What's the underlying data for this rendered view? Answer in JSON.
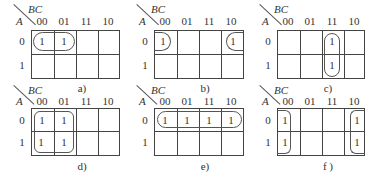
{
  "figure": {
    "row_variable": "A",
    "col_variable": "BC",
    "column_headers": [
      "00",
      "01",
      "11",
      "10"
    ],
    "row_headers": [
      "0",
      "1"
    ],
    "maps": [
      {
        "id": "a",
        "caption": "a)",
        "cells": [
          [
            "1",
            "1",
            "",
            ""
          ],
          [
            "",
            "",
            "",
            ""
          ]
        ],
        "grouping": "row 0, columns 00-01 (horizontal pair)"
      },
      {
        "id": "b",
        "caption": "b)",
        "cells": [
          [
            "1",
            "",
            "",
            "1"
          ],
          [
            "",
            "",
            "",
            ""
          ]
        ],
        "grouping": "row 0, columns 00 and 10 (wrap-around pair)"
      },
      {
        "id": "c",
        "caption": "c)",
        "cells": [
          [
            "",
            "",
            "1",
            ""
          ],
          [
            "",
            "",
            "1",
            ""
          ]
        ],
        "grouping": "column 11, rows 0-1 (vertical pair)"
      },
      {
        "id": "d",
        "caption": "d)",
        "cells": [
          [
            "1",
            "1",
            "",
            ""
          ],
          [
            "1",
            "1",
            "",
            ""
          ]
        ],
        "grouping": "columns 00-01, rows 0-1 (quad)"
      },
      {
        "id": "e",
        "caption": "e)",
        "cells": [
          [
            "1",
            "1",
            "1",
            "1"
          ],
          [
            "",
            "",
            "",
            ""
          ]
        ],
        "grouping": "row 0, all columns (quad)"
      },
      {
        "id": "f",
        "caption": "f )",
        "cells": [
          [
            "1",
            "",
            "",
            "1"
          ],
          [
            "1",
            "",
            "",
            "1"
          ]
        ],
        "grouping": "columns 00 and 10, rows 0-1 (wrap-around quad)"
      }
    ]
  }
}
